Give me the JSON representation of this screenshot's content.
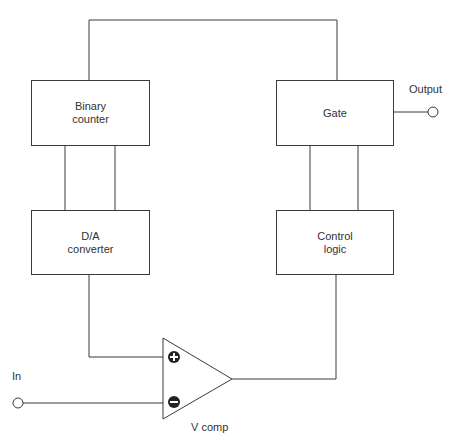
{
  "diagram": {
    "type": "block-diagram",
    "blocks": {
      "binary_counter": {
        "line1": "Binary",
        "line2": "counter"
      },
      "gate": {
        "line1": "Gate"
      },
      "da_converter": {
        "line1": "D/A",
        "line2": "converter"
      },
      "control_logic": {
        "line1": "Control",
        "line2": "logic"
      }
    },
    "comparator": {
      "label": "V comp",
      "plus": "+",
      "minus": "−"
    },
    "terminals": {
      "input": "In",
      "output": "Output"
    },
    "colors": {
      "line": "#3a3a3a",
      "text": "#333333",
      "background": "#ffffff"
    }
  }
}
